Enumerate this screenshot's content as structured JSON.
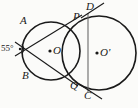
{
  "figure": {
    "background_color": "#fbfbf9",
    "stroke_color": "#1a1a1a",
    "width": 138,
    "height": 108,
    "angle_annotation": {
      "text": "55°",
      "value": 55,
      "unit": "degrees",
      "at_vertex": "external-left-vertex"
    },
    "circles": [
      {
        "name": "left-circle",
        "center_label": "O",
        "cx": 51,
        "cy": 51,
        "r": 29
      },
      {
        "name": "right-circle",
        "center_label": "O'",
        "cx": 99,
        "cy": 53,
        "r": 37
      }
    ],
    "points": [
      {
        "label": "A",
        "x": 28,
        "y": 28,
        "on": "left-circle"
      },
      {
        "label": "B",
        "x": 30,
        "y": 73,
        "on": "left-circle"
      },
      {
        "label": "P",
        "x": 74,
        "y": 22,
        "on": "both-circles-intersection"
      },
      {
        "label": "Q",
        "x": 71,
        "y": 80,
        "on": "both-circles-intersection"
      },
      {
        "label": "D",
        "x": 88,
        "y": 13,
        "on": "right-circle"
      },
      {
        "label": "C",
        "x": 88,
        "y": 92,
        "on": "right-circle"
      },
      {
        "label": "O",
        "x": 51,
        "y": 51,
        "on": "center-left-circle"
      },
      {
        "label": "O'",
        "x": 99,
        "y": 53,
        "on": "center-right-circle"
      }
    ],
    "lines": [
      {
        "name": "line-A-Q",
        "from": "A",
        "to": "Q",
        "extends_beyond": "A"
      },
      {
        "name": "line-B-P",
        "from": "B",
        "to": "P",
        "extends_beyond": "B"
      },
      {
        "name": "chord-D-C",
        "from": "D",
        "to": "C",
        "extends_beyond": "both"
      }
    ],
    "labels": {
      "A": "A",
      "B": "B",
      "C": "C",
      "D": "D",
      "P": "P",
      "Q": "Q",
      "O": "O",
      "O_prime": "O'",
      "angle": "55°"
    }
  }
}
